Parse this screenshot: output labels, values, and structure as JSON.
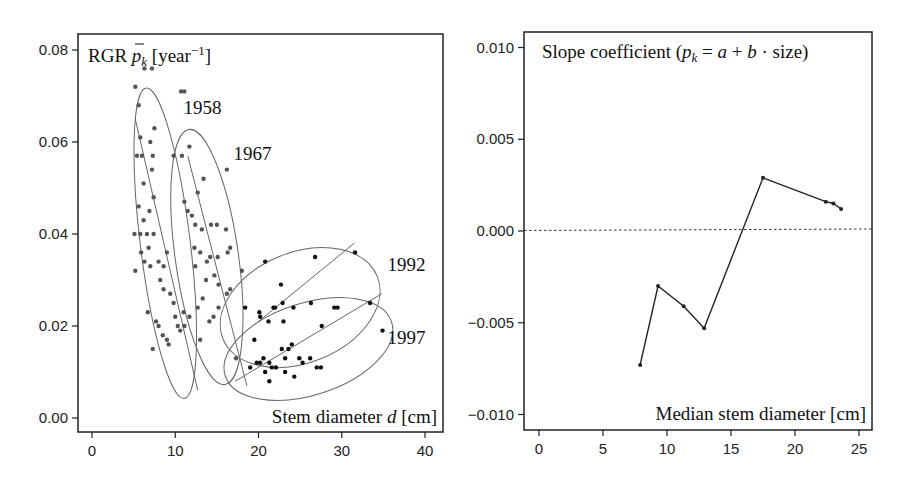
{
  "chart_data": [
    {
      "type": "scatter",
      "title": "RGR p̄_k [year⁻¹]",
      "xlabel": "Stem diameter d [cm]",
      "ylabel": "RGR p̄_k [year⁻¹]",
      "xlim": [
        -1,
        41
      ],
      "ylim": [
        -0.002,
        0.083
      ],
      "xticks": [
        0,
        10,
        20,
        30,
        40
      ],
      "yticks": [
        0.0,
        0.02,
        0.04,
        0.06,
        0.08
      ],
      "xtick_labels": [
        "0",
        "10",
        "20",
        "30",
        "40"
      ],
      "ytick_labels": [
        "0.00",
        "0.02",
        "0.04",
        "0.06",
        "0.08"
      ],
      "grid": false,
      "series": [
        {
          "name": "1958",
          "ellipse": {
            "cx": 8.8,
            "cy": 0.038,
            "rx": 3.0,
            "ry": 0.034,
            "angle_deg": -7
          },
          "fit_line": [
            [
              5.2,
              0.065
            ],
            [
              12.7,
              0.006
            ]
          ],
          "points": [
            [
              5.2,
              0.072
            ],
            [
              5.6,
              0.068
            ],
            [
              6.3,
              0.076
            ],
            [
              7.2,
              0.076
            ],
            [
              5.8,
              0.061
            ],
            [
              5.4,
              0.057
            ],
            [
              6.0,
              0.057
            ],
            [
              7.0,
              0.06
            ],
            [
              7.3,
              0.057
            ],
            [
              7.5,
              0.063
            ],
            [
              6.2,
              0.051
            ],
            [
              7.2,
              0.054
            ],
            [
              7.4,
              0.048
            ],
            [
              5.6,
              0.046
            ],
            [
              6.2,
              0.043
            ],
            [
              6.9,
              0.045
            ],
            [
              5.1,
              0.04
            ],
            [
              5.8,
              0.04
            ],
            [
              6.6,
              0.04
            ],
            [
              7.4,
              0.04
            ],
            [
              5.2,
              0.032
            ],
            [
              5.9,
              0.036
            ],
            [
              6.3,
              0.034
            ],
            [
              6.8,
              0.037
            ],
            [
              7.0,
              0.033
            ],
            [
              6.7,
              0.023
            ],
            [
              7.3,
              0.015
            ],
            [
              7.7,
              0.021
            ],
            [
              8.0,
              0.02
            ],
            [
              8.5,
              0.018
            ],
            [
              9.0,
              0.017
            ],
            [
              9.2,
              0.016
            ],
            [
              8.2,
              0.03
            ],
            [
              8.6,
              0.028
            ],
            [
              9.4,
              0.027
            ],
            [
              9.8,
              0.025
            ],
            [
              10.0,
              0.022
            ],
            [
              10.3,
              0.02
            ],
            [
              10.6,
              0.019
            ],
            [
              11.1,
              0.02
            ],
            [
              8.0,
              0.034
            ],
            [
              8.6,
              0.033
            ],
            [
              9.0,
              0.036
            ]
          ]
        },
        {
          "name": "1967",
          "ellipse": {
            "cx": 13.8,
            "cy": 0.035,
            "rx": 3.8,
            "ry": 0.028,
            "angle_deg": -8
          },
          "fit_line": [
            [
              11.5,
              0.057
            ],
            [
              18.6,
              0.007
            ]
          ],
          "points": [
            [
              10.7,
              0.071
            ],
            [
              11.1,
              0.071
            ],
            [
              11.7,
              0.059
            ],
            [
              9.8,
              0.057
            ],
            [
              10.8,
              0.057
            ],
            [
              13.4,
              0.052
            ],
            [
              16.2,
              0.054
            ],
            [
              12.7,
              0.049
            ],
            [
              11.1,
              0.047
            ],
            [
              11.5,
              0.045
            ],
            [
              12.0,
              0.044
            ],
            [
              12.4,
              0.042
            ],
            [
              13.2,
              0.041
            ],
            [
              14.3,
              0.042
            ],
            [
              15.0,
              0.042
            ],
            [
              16.1,
              0.041
            ],
            [
              12.3,
              0.037
            ],
            [
              13.0,
              0.036
            ],
            [
              13.8,
              0.034
            ],
            [
              14.2,
              0.035
            ],
            [
              15.1,
              0.035
            ],
            [
              16.3,
              0.036
            ],
            [
              16.6,
              0.037
            ],
            [
              12.4,
              0.033
            ],
            [
              13.7,
              0.03
            ],
            [
              14.7,
              0.031
            ],
            [
              15.2,
              0.029
            ],
            [
              16.2,
              0.027
            ],
            [
              16.6,
              0.028
            ],
            [
              11.0,
              0.023
            ],
            [
              11.7,
              0.022
            ],
            [
              12.7,
              0.024
            ],
            [
              13.3,
              0.026
            ],
            [
              14.1,
              0.021
            ],
            [
              14.6,
              0.022
            ],
            [
              15.2,
              0.024
            ],
            [
              13.0,
              0.017
            ],
            [
              17.3,
              0.013
            ],
            [
              18.0,
              0.032
            ]
          ]
        },
        {
          "name": "1992",
          "ellipse": {
            "cx": 25.0,
            "cy": 0.024,
            "rx": 10.0,
            "ry": 0.012,
            "angle_deg": -22
          },
          "fit_line": [
            [
              20.0,
              0.021
            ],
            [
              31.5,
              0.038
            ]
          ],
          "points": [
            [
              20.8,
              0.034
            ],
            [
              26.8,
              0.035
            ],
            [
              31.6,
              0.036
            ],
            [
              22.7,
              0.029
            ],
            [
              20.1,
              0.023
            ],
            [
              20.2,
              0.022
            ],
            [
              21.8,
              0.024
            ],
            [
              22.0,
              0.024
            ],
            [
              22.9,
              0.025
            ],
            [
              23.0,
              0.021
            ],
            [
              21.2,
              0.021
            ],
            [
              26.3,
              0.025
            ],
            [
              24.2,
              0.024
            ],
            [
              29.1,
              0.024
            ],
            [
              29.5,
              0.024
            ],
            [
              18.4,
              0.024
            ],
            [
              19.5,
              0.017
            ]
          ]
        },
        {
          "name": "1997",
          "ellipse": {
            "cx": 26.0,
            "cy": 0.015,
            "rx": 10.5,
            "ry": 0.01,
            "angle_deg": -18
          },
          "fit_line": [
            [
              17.2,
              0.008
            ],
            [
              34.8,
              0.027
            ]
          ],
          "points": [
            [
              19.0,
              0.011
            ],
            [
              19.8,
              0.012
            ],
            [
              20.2,
              0.012
            ],
            [
              20.8,
              0.01
            ],
            [
              21.3,
              0.012
            ],
            [
              21.6,
              0.011
            ],
            [
              22.1,
              0.011
            ],
            [
              22.8,
              0.015
            ],
            [
              23.2,
              0.013
            ],
            [
              23.6,
              0.015
            ],
            [
              24.0,
              0.016
            ],
            [
              24.3,
              0.009
            ],
            [
              24.9,
              0.013
            ],
            [
              25.3,
              0.012
            ],
            [
              21.3,
              0.008
            ],
            [
              23.2,
              0.01
            ],
            [
              27.0,
              0.011
            ],
            [
              27.5,
              0.011
            ],
            [
              27.6,
              0.02
            ],
            [
              26.2,
              0.013
            ],
            [
              33.4,
              0.025
            ],
            [
              34.9,
              0.019
            ],
            [
              20.6,
              0.013
            ]
          ]
        }
      ],
      "annotations": [
        {
          "text": "1958",
          "x": 11.0,
          "y": 0.066
        },
        {
          "text": "1967",
          "x": 17.0,
          "y": 0.056
        },
        {
          "text": "1992",
          "x": 35.5,
          "y": 0.032
        },
        {
          "text": "1997",
          "x": 35.5,
          "y": 0.016
        }
      ]
    },
    {
      "type": "line",
      "title": "Slope coefficient (p̄_k = a + b · size)",
      "xlabel": "Median stem diameter [cm]",
      "ylabel": "Slope coefficient",
      "xlim": [
        -1,
        26
      ],
      "ylim": [
        -0.011,
        0.011
      ],
      "xticks": [
        0,
        5,
        10,
        15,
        20,
        25
      ],
      "yticks": [
        -0.01,
        -0.005,
        0.0,
        0.005,
        0.01
      ],
      "xtick_labels": [
        "0",
        "5",
        "10",
        "15",
        "20",
        "25"
      ],
      "ytick_labels": [
        "-0.010",
        "-0.005",
        "0.000",
        "0.005",
        "0.010"
      ],
      "grid": false,
      "reference_line": {
        "y": 0.0,
        "style": "dotted"
      },
      "series": [
        {
          "name": "slope",
          "x": [
            7.9,
            9.3,
            11.3,
            12.9,
            17.5,
            22.4,
            23.0,
            23.6
          ],
          "values": [
            -0.0073,
            -0.003,
            -0.0041,
            -0.0053,
            0.0029,
            0.0016,
            0.0015,
            0.0012
          ]
        }
      ]
    }
  ],
  "left_panel": {
    "title_prefix": "RGR ",
    "title_var": "p",
    "title_sub": "k",
    "title_unit_open": " [year",
    "title_unit_exp": "−1",
    "title_unit_close": "]",
    "xlabel_prefix": "Stem diameter ",
    "xlabel_var": "d",
    "xlabel_suffix": " [cm]"
  },
  "right_panel": {
    "title_prefix": "Slope coefficient (",
    "title_var": "p",
    "title_sub": "k",
    "title_eq": " = ",
    "title_a": "a",
    "title_plus": " + ",
    "title_b": "b",
    "title_rest": " · size)",
    "xlabel": "Median stem diameter [cm]"
  },
  "colors": {
    "axis": "#222222",
    "points_early": "#555555",
    "points_late": "#111111",
    "ellipse": "#666666",
    "line": "#222222"
  }
}
